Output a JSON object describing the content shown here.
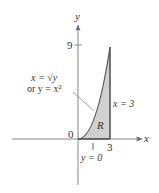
{
  "diagram": {
    "axes": {
      "x_label": "x",
      "y_label": "y",
      "origin_label": "0",
      "x_tick_label": "3",
      "y_tick_label": "9"
    },
    "curve": {
      "label_line1": "x = √y",
      "label_line2": "or y = x²"
    },
    "region": {
      "label": "R",
      "fill_color": "#d0d0d0"
    },
    "boundaries": {
      "right_label": "x = 3",
      "bottom_label": "y = 0"
    },
    "colors": {
      "axis": "#888888",
      "curve": "#555555",
      "text": "#333333"
    }
  }
}
